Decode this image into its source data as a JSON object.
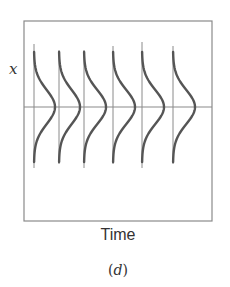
{
  "figure": {
    "ylabel": "x",
    "xlabel": "Time",
    "caption_open": "(",
    "caption_letter": "d",
    "caption_close": ")"
  },
  "colors": {
    "frame": "#8a8a8a",
    "axis_lines": "#8a8a8a",
    "curve": "#555555",
    "text": "#333333"
  },
  "chart_data": {
    "type": "line",
    "title": "",
    "xlabel": "Time",
    "ylabel": "x",
    "grid": false,
    "series": [
      {
        "name": "t1",
        "time_marker_x": 34,
        "peak_offset": 21,
        "top": 44
      },
      {
        "name": "t2",
        "time_marker_x": 59,
        "peak_offset": 21,
        "top": 50
      },
      {
        "name": "t3",
        "time_marker_x": 84,
        "peak_offset": 22,
        "top": 50
      },
      {
        "name": "t4",
        "time_marker_x": 113,
        "peak_offset": 22,
        "top": 46
      },
      {
        "name": "t5",
        "time_marker_x": 142,
        "peak_offset": 22,
        "top": 42
      },
      {
        "name": "t6",
        "time_marker_x": 173,
        "peak_offset": 22,
        "top": 46
      }
    ],
    "mean_line_y": 107
  }
}
